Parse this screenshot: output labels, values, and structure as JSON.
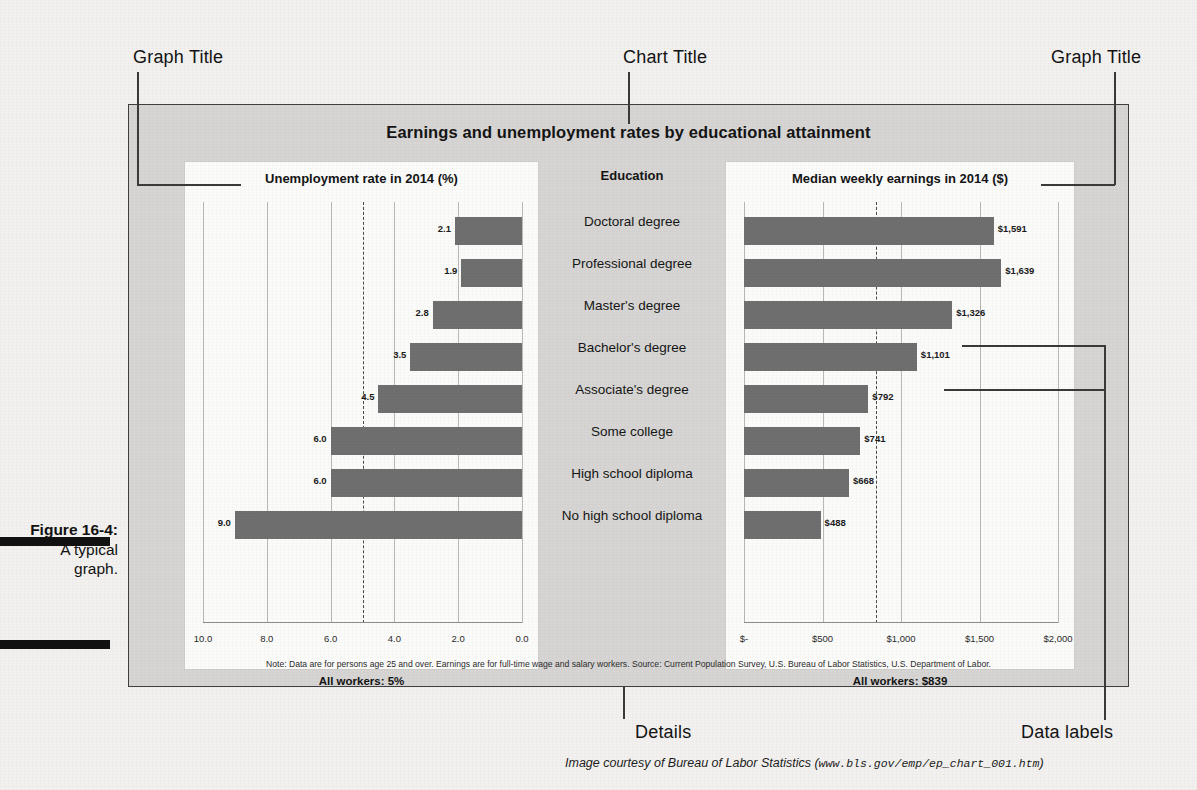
{
  "figure": {
    "caption_line1": "Figure 16-4:",
    "caption_line2": "A typical",
    "caption_line3": "graph."
  },
  "annotations": {
    "graph_title_left": "Graph Title",
    "chart_title": "Chart Title",
    "graph_title_right": "Graph Title",
    "details": "Details",
    "data_labels": "Data labels"
  },
  "credit": {
    "text": "Image courtesy of Bureau of Labor Statistics (",
    "url": "www.bls.gov/emp/ep_chart_001.htm",
    "close": ")"
  },
  "chart": {
    "title": "Earnings and unemployment rates by educational attainment",
    "education_header": "Education",
    "note": "Note: Data are for persons age 25 and over. Earnings are for full-time wage and salary workers. Source: Current Population Survey, U.S. Bureau of Labor Statistics, U.S. Department of Labor.",
    "all_workers_left": "All workers: 5%",
    "all_workers_right": "All workers: $839",
    "colors": {
      "bar": "#6f6f6f",
      "panel_background": "#d6d5d3",
      "card_background": "#fbfbfa",
      "border": "#3f3f3f"
    }
  },
  "chart_data": [
    {
      "type": "bar",
      "orientation": "horizontal",
      "direction": "right-to-left",
      "title": "Unemployment rate in 2014 (%)",
      "xlabel": "",
      "ylabel": "Education",
      "categories": [
        "Doctoral degree",
        "Professional degree",
        "Master's degree",
        "Bachelor's degree",
        "Associate's degree",
        "Some college",
        "High school diploma",
        "No high school diploma"
      ],
      "values": [
        2.1,
        1.9,
        2.8,
        3.5,
        4.5,
        6.0,
        6.0,
        9.0
      ],
      "labels": [
        "2.1",
        "1.9",
        "2.8",
        "3.5",
        "4.5",
        "6.0",
        "6.0",
        "9.0"
      ],
      "xlim": [
        0,
        10
      ],
      "ticks": [
        "10.0",
        "8.0",
        "6.0",
        "4.0",
        "2.0",
        "0.0"
      ],
      "tick_values": [
        10.0,
        8.0,
        6.0,
        4.0,
        2.0,
        0.0
      ],
      "reference_line": {
        "value": 5.0,
        "label": "All workers: 5%",
        "style": "dashed"
      },
      "grid": true,
      "legend": "none"
    },
    {
      "type": "bar",
      "orientation": "horizontal",
      "direction": "left-to-right",
      "title": "Median weekly earnings in 2014 ($)",
      "xlabel": "",
      "ylabel": "Education",
      "categories": [
        "Doctoral degree",
        "Professional degree",
        "Master's degree",
        "Bachelor's degree",
        "Associate's degree",
        "Some college",
        "High school diploma",
        "No high school diploma"
      ],
      "values": [
        1591,
        1639,
        1326,
        1101,
        792,
        741,
        668,
        488
      ],
      "labels": [
        "$1,591",
        "$1,639",
        "$1,326",
        "$1,101",
        "$792",
        "$741",
        "$668",
        "$488"
      ],
      "xlim": [
        0,
        2000
      ],
      "ticks": [
        "$-",
        "$500",
        "$1,000",
        "$1,500",
        "$2,000"
      ],
      "tick_values": [
        0,
        500,
        1000,
        1500,
        2000
      ],
      "reference_line": {
        "value": 839,
        "label": "All workers: $839",
        "style": "dashed"
      },
      "grid": true,
      "legend": "none"
    }
  ]
}
